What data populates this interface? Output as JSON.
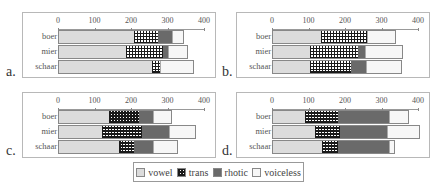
{
  "chart_data": [
    {
      "type": "bar",
      "orientation": "horizontal",
      "stacked": true,
      "panel_label": "a.",
      "categories": [
        "boer",
        "mier",
        "schaar"
      ],
      "series": [
        {
          "name": "vowel",
          "values": [
            208,
            186,
            258
          ]
        },
        {
          "name": "trans",
          "values": [
            69,
            104,
            24
          ]
        },
        {
          "name": "rhotic",
          "values": [
            38,
            14,
            0
          ]
        },
        {
          "name": "voiceless",
          "values": [
            30,
            52,
            90
          ]
        }
      ],
      "xlim": [
        0,
        400
      ],
      "xticks": [
        "0",
        "100",
        "200",
        "300",
        "400"
      ]
    },
    {
      "type": "bar",
      "orientation": "horizontal",
      "stacked": true,
      "panel_label": "b.",
      "categories": [
        "boer",
        "mier",
        "schaar"
      ],
      "series": [
        {
          "name": "vowel",
          "values": [
            134,
            104,
            104
          ]
        },
        {
          "name": "trans",
          "values": [
            127,
            133,
            114
          ]
        },
        {
          "name": "rhotic",
          "values": [
            2,
            20,
            41
          ]
        },
        {
          "name": "voiceless",
          "values": [
            77,
            103,
            98
          ]
        }
      ],
      "xlim": [
        0,
        400
      ],
      "xticks": [
        "0",
        "100",
        "200",
        "300",
        "400"
      ]
    },
    {
      "type": "bar",
      "orientation": "horizontal",
      "stacked": true,
      "panel_label": "c.",
      "categories": [
        "boer",
        "mier",
        "schaar"
      ],
      "series": [
        {
          "name": "vowel",
          "values": [
            140,
            120,
            168
          ]
        },
        {
          "name": "trans",
          "values": [
            82,
            111,
            40
          ]
        },
        {
          "name": "rhotic",
          "values": [
            40,
            75,
            54
          ]
        },
        {
          "name": "voiceless",
          "values": [
            51,
            71,
            66
          ]
        }
      ],
      "xlim": [
        0,
        400
      ],
      "xticks": [
        "0",
        "100",
        "200",
        "300",
        "400"
      ]
    },
    {
      "type": "bar",
      "orientation": "horizontal",
      "stacked": true,
      "panel_label": "d.",
      "categories": [
        "boer",
        "mier",
        "schaar"
      ],
      "series": [
        {
          "name": "vowel",
          "values": [
            88,
            116,
            136
          ]
        },
        {
          "name": "trans",
          "values": [
            94,
            71,
            46
          ]
        },
        {
          "name": "rhotic",
          "values": [
            140,
            130,
            140
          ]
        },
        {
          "name": "voiceless",
          "values": [
            54,
            88,
            15
          ]
        }
      ],
      "xlim": [
        0,
        400
      ],
      "xticks": [
        "0",
        "100",
        "200",
        "300",
        "400"
      ]
    }
  ],
  "legend": {
    "position": "bottom-center",
    "items": [
      {
        "label": "vowel",
        "color": "#dcdcdc",
        "pattern": "solid"
      },
      {
        "label": "trans",
        "color": "#1a1a1a",
        "pattern": "checkered"
      },
      {
        "label": "rhotic",
        "color": "#6a6a6a",
        "pattern": "solid"
      },
      {
        "label": "voiceless",
        "color": "#f7f7f7",
        "pattern": "solid"
      }
    ]
  }
}
